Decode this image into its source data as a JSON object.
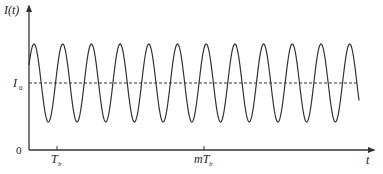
{
  "chart_data": {
    "type": "line",
    "title": "",
    "xlabel": "t",
    "ylabel": "I(t)",
    "origin_label": "0",
    "series": [
      {
        "name": "I(t)",
        "description": "Sinusoidal oscillation about mean I0 with period T_b",
        "mean_label": "I0",
        "period_label": "T_b",
        "cycles": 11.3,
        "amplitude_relative": 0.5
      }
    ],
    "reference_lines": [
      {
        "label": "I0",
        "style": "dashed",
        "orientation": "horizontal"
      }
    ],
    "x_ticks": [
      {
        "label": "T_b",
        "main": "T",
        "sub": "b"
      },
      {
        "label": "mT_b",
        "main": "mT",
        "sub": "b"
      }
    ],
    "y_ticks": [
      {
        "label": "0"
      },
      {
        "label": "I0",
        "main": "I",
        "sub": "0"
      }
    ],
    "grid": false,
    "legend": "none"
  },
  "labels": {
    "y_axis": "I(t)",
    "x_axis": "t",
    "origin": "0",
    "i0_main": "I",
    "i0_sub": "0",
    "tb_main": "T",
    "tb_sub": "b",
    "mtb_main": "mT",
    "mtb_sub": "b"
  },
  "geometry": {
    "axis_x": 29,
    "axis_y": 150,
    "mean_y": 83,
    "amplitude_px": 39,
    "period_px": 28.7,
    "first_peak_x": 34,
    "curve_end_x": 359
  }
}
